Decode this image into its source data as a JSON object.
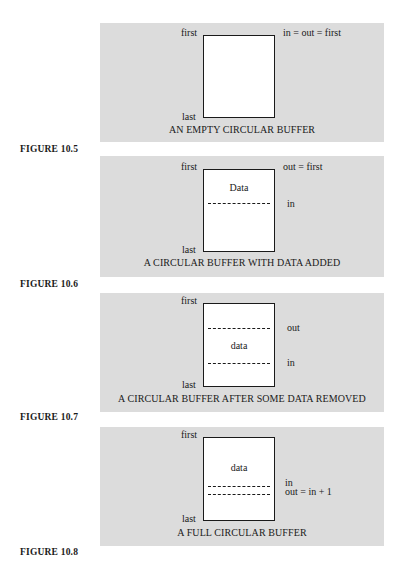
{
  "figures": [
    {
      "label": "FIGURE 10.5",
      "caption": "AN EMPTY CIRCULAR BUFFER",
      "top_label": "first",
      "bottom_label": "last",
      "right_labels": [
        "in = out = first"
      ],
      "inner_text": "",
      "dashed_lines": 0
    },
    {
      "label": "FIGURE 10.6",
      "caption": "A CIRCULAR BUFFER WITH DATA ADDED",
      "top_label": "first",
      "bottom_label": "last",
      "right_labels": [
        "out = first",
        "in"
      ],
      "inner_text": "Data",
      "dashed_lines": 1
    },
    {
      "label": "FIGURE 10.7",
      "caption": "A CIRCULAR BUFFER AFTER SOME DATA REMOVED",
      "top_label": "first",
      "bottom_label": "last",
      "right_labels": [
        "out",
        "in"
      ],
      "inner_text": "data",
      "dashed_lines": 2
    },
    {
      "label": "FIGURE 10.8",
      "caption": "A FULL CIRCULAR BUFFER",
      "top_label": "first",
      "bottom_label": "last",
      "right_labels": [
        "in",
        "out = in + 1"
      ],
      "inner_text": "data",
      "dashed_lines": 2
    }
  ]
}
